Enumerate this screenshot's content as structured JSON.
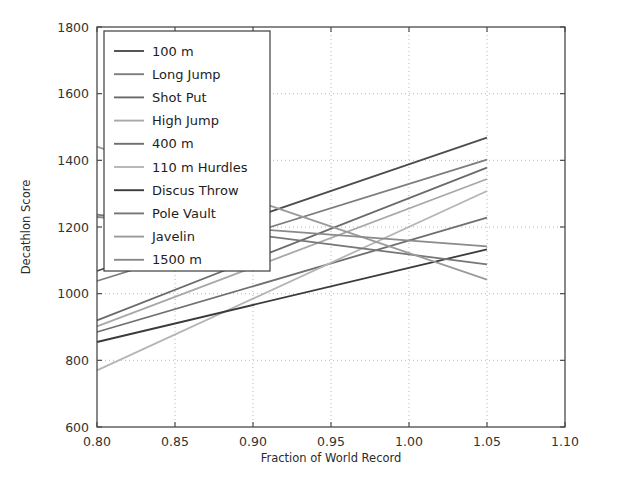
{
  "chart_data": {
    "type": "line",
    "title": "",
    "xlabel": "Fraction of World Record",
    "ylabel": "Decathlon Score",
    "xlim": [
      0.8,
      1.1
    ],
    "ylim": [
      600,
      1800
    ],
    "xticks": [
      "0.80",
      "0.85",
      "0.90",
      "0.95",
      "1.00",
      "1.05",
      "1.10"
    ],
    "xtick_values": [
      0.8,
      0.85,
      0.9,
      0.95,
      1.0,
      1.05,
      1.1
    ],
    "yticks": [
      "600",
      "800",
      "1000",
      "1200",
      "1400",
      "1600",
      "1800"
    ],
    "ytick_values": [
      600,
      800,
      1000,
      1200,
      1400,
      1600,
      1800
    ],
    "grid": true,
    "legend_position": "upper left",
    "x": [
      0.8,
      1.05
    ],
    "series": [
      {
        "name": "100 m",
        "color": "#4c4c4c",
        "x": [
          0.8,
          1.05
        ],
        "values": [
          1068,
          1468
        ]
      },
      {
        "name": "Long Jump",
        "color": "#7d7d7d",
        "x": [
          0.8,
          1.05
        ],
        "values": [
          1038,
          1402
        ]
      },
      {
        "name": "Shot Put",
        "color": "#6a6a6a",
        "x": [
          0.8,
          1.05
        ],
        "values": [
          920,
          1378
        ]
      },
      {
        "name": "High Jump",
        "color": "#a8a8a8",
        "x": [
          0.8,
          1.05
        ],
        "values": [
          902,
          1344
        ]
      },
      {
        "name": "400 m",
        "color": "#6f6f6f",
        "x": [
          0.8,
          1.05
        ],
        "values": [
          885,
          1228
        ]
      },
      {
        "name": "110 m Hurdles",
        "color": "#b5b5b5",
        "x": [
          0.8,
          1.05
        ],
        "values": [
          770,
          1308
        ]
      },
      {
        "name": "Discus Throw",
        "color": "#3a3a3a",
        "x": [
          0.8,
          1.05
        ],
        "values": [
          855,
          1133
        ]
      },
      {
        "name": "Pole Vault",
        "color": "#777777",
        "x": [
          0.8,
          1.05
        ],
        "values": [
          1237,
          1088
        ]
      },
      {
        "name": "Javelin",
        "color": "#9a9a9a",
        "x": [
          0.8,
          1.05
        ],
        "values": [
          1441,
          1042
        ]
      },
      {
        "name": "1500 m",
        "color": "#8a8a8a",
        "x": [
          0.8,
          1.05
        ],
        "values": [
          1230,
          1142
        ]
      }
    ]
  },
  "legend": {
    "items": [
      {
        "label": "100 m"
      },
      {
        "label": "Long Jump"
      },
      {
        "label": "Shot Put"
      },
      {
        "label": "High Jump"
      },
      {
        "label": "400 m"
      },
      {
        "label": "110 m Hurdles"
      },
      {
        "label": "Discus Throw"
      },
      {
        "label": "Pole Vault"
      },
      {
        "label": "Javelin"
      },
      {
        "label": "1500 m"
      }
    ]
  }
}
